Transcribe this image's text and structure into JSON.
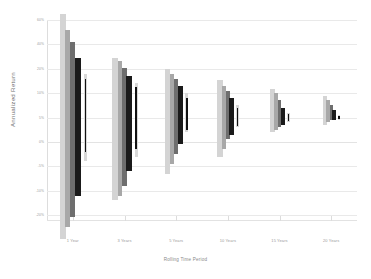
{
  "chart_data": {
    "type": "bar",
    "subtype": "floating-range-bar",
    "title": "",
    "xlabel": "Rolling Time Period",
    "ylabel": "Annualized Return",
    "grid": true,
    "legend": "none",
    "categories": [
      "1 Year",
      "3 Years",
      "5 Years",
      "10 Years",
      "15 Years",
      "20 Years"
    ],
    "yticks": [
      "60%",
      "40%",
      "20%",
      "10%",
      "5%",
      "0%",
      "-5%",
      "-10%",
      "-20%"
    ],
    "ytick_values": [
      60,
      40,
      20,
      10,
      5,
      0,
      -5,
      -10,
      -20
    ],
    "ylim": [
      -20,
      60
    ],
    "series": [
      {
        "name": "Series 1",
        "color": "#d4d4d4",
        "ranges": [
          {
            "category": "1 Year",
            "high": 65.0,
            "low": -30.0
          },
          {
            "category": "3 Years",
            "high": 29.0,
            "low": -14.0
          },
          {
            "category": "5 Years",
            "high": 20.0,
            "low": -6.5
          },
          {
            "category": "10 Years",
            "high": 15.5,
            "low": -3.0
          },
          {
            "category": "15 Years",
            "high": 11.5,
            "low": 2.0
          },
          {
            "category": "20 Years",
            "high": 9.5,
            "low": 3.5
          }
        ]
      },
      {
        "name": "Series 2",
        "color": "#a8a8a8",
        "ranges": [
          {
            "category": "1 Year",
            "high": 52.0,
            "low": -25.0
          },
          {
            "category": "3 Years",
            "high": 26.0,
            "low": -12.0
          },
          {
            "category": "5 Years",
            "high": 18.0,
            "low": -4.5
          },
          {
            "category": "10 Years",
            "high": 13.0,
            "low": -1.5
          },
          {
            "category": "15 Years",
            "high": 10.0,
            "low": 2.5
          },
          {
            "category": "20 Years",
            "high": 8.5,
            "low": 4.0
          }
        ]
      },
      {
        "name": "Series 3",
        "color": "#6e6e6e",
        "ranges": [
          {
            "category": "1 Year",
            "high": 42.0,
            "low": -21.0
          },
          {
            "category": "3 Years",
            "high": 21.0,
            "low": -9.0
          },
          {
            "category": "5 Years",
            "high": 16.0,
            "low": -2.5
          },
          {
            "category": "10 Years",
            "high": 11.0,
            "low": 0.5
          },
          {
            "category": "15 Years",
            "high": 8.5,
            "low": 3.0
          },
          {
            "category": "20 Years",
            "high": 7.5,
            "low": 4.5
          }
        ]
      },
      {
        "name": "Series 4",
        "color": "#1a1a1a",
        "ranges": [
          {
            "category": "1 Year",
            "high": 29.0,
            "low": -12.0
          },
          {
            "category": "3 Years",
            "high": 17.0,
            "low": -6.0
          },
          {
            "category": "5 Years",
            "high": 13.0,
            "low": -0.5
          },
          {
            "category": "10 Years",
            "high": 9.0,
            "low": 1.5
          },
          {
            "category": "15 Years",
            "high": 7.0,
            "low": 3.5
          },
          {
            "category": "20 Years",
            "high": 6.5,
            "low": 4.5
          }
        ]
      },
      {
        "name": "Series 5",
        "color": "#d8d8d8",
        "ranges": [
          {
            "category": "1 Year",
            "high": 18.0,
            "low": -4.0
          },
          {
            "category": "3 Years",
            "high": 14.0,
            "low": -3.0
          },
          {
            "category": "5 Years",
            "high": 10.0,
            "low": 2.0
          },
          {
            "category": "10 Years",
            "high": 7.5,
            "low": 3.0
          },
          {
            "category": "15 Years",
            "high": 6.0,
            "low": 4.0
          },
          {
            "category": "20 Years",
            "high": 5.5,
            "low": 4.5
          }
        ]
      }
    ],
    "inner_series": [
      {
        "name": "Series 5 inner",
        "color": "#111111",
        "ranges": [
          {
            "category": "1 Year",
            "high": 16.0,
            "low": -2.0
          },
          {
            "category": "3 Years",
            "high": 12.5,
            "low": -1.5
          },
          {
            "category": "5 Years",
            "high": 9.0,
            "low": 2.5
          },
          {
            "category": "10 Years",
            "high": 7.0,
            "low": 3.3
          },
          {
            "category": "15 Years",
            "high": 5.8,
            "low": 4.2
          },
          {
            "category": "20 Years",
            "high": 5.3,
            "low": 4.7
          }
        ]
      }
    ]
  }
}
